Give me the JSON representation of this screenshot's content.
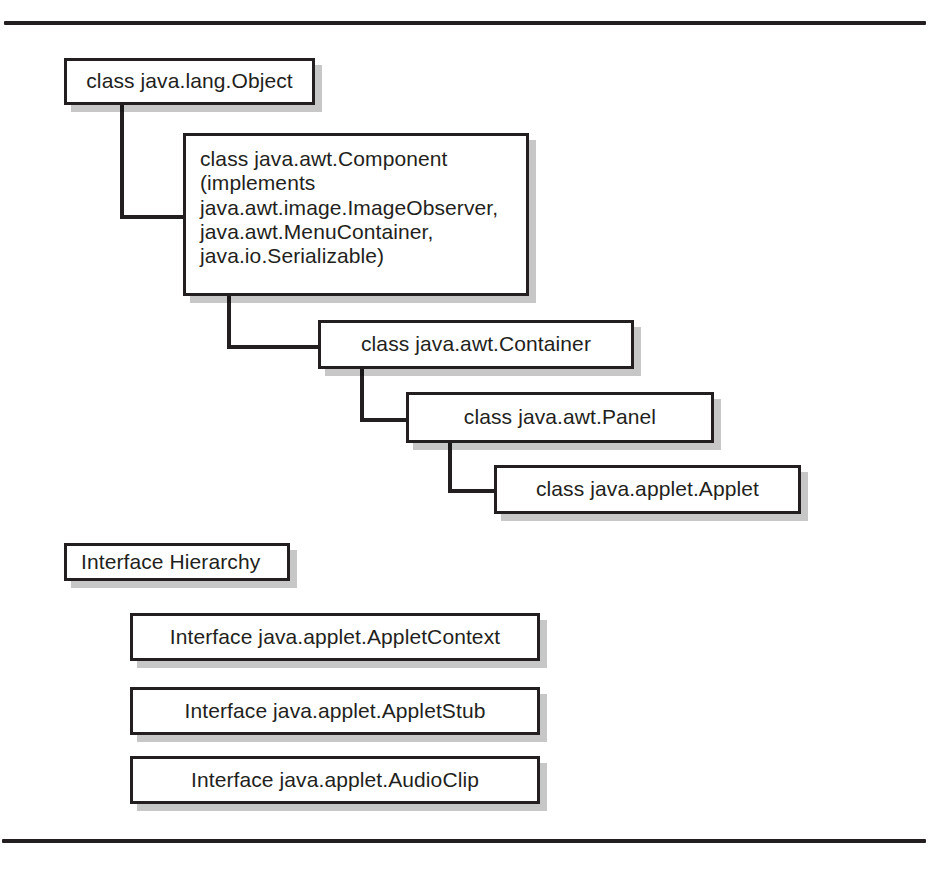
{
  "page": {
    "width": 933,
    "height": 869,
    "background": "#ffffff",
    "ink_color": "#231f20",
    "shadow_color": "rgba(0,0,0,0.22)"
  },
  "rules": {
    "top_label": "top-horizontal-rule",
    "bottom_label": "bottom-horizontal-rule"
  },
  "class_hierarchy": {
    "nodes": [
      {
        "id": "object",
        "label": "class java.lang.Object"
      },
      {
        "id": "component",
        "label": "   class java.awt.Component\n(implements\njava.awt.image.ImageObserver,\njava.awt.MenuContainer,\njava.io.Serializable)"
      },
      {
        "id": "container",
        "label": "class java.awt.Container"
      },
      {
        "id": "panel",
        "label": "class java.awt.Panel"
      },
      {
        "id": "applet",
        "label": "class java.applet.Applet"
      }
    ],
    "edges": [
      {
        "from": "object",
        "to": "component"
      },
      {
        "from": "component",
        "to": "container"
      },
      {
        "from": "container",
        "to": "panel"
      },
      {
        "from": "panel",
        "to": "applet"
      }
    ]
  },
  "interface_hierarchy": {
    "heading": "Interface Hierarchy",
    "nodes": [
      {
        "id": "appletcontext",
        "label": "Interface java.applet.AppletContext"
      },
      {
        "id": "appletstub",
        "label": "Interface java.applet.AppletStub"
      },
      {
        "id": "audioclip",
        "label": "Interface java.applet.AudioClip"
      }
    ]
  }
}
